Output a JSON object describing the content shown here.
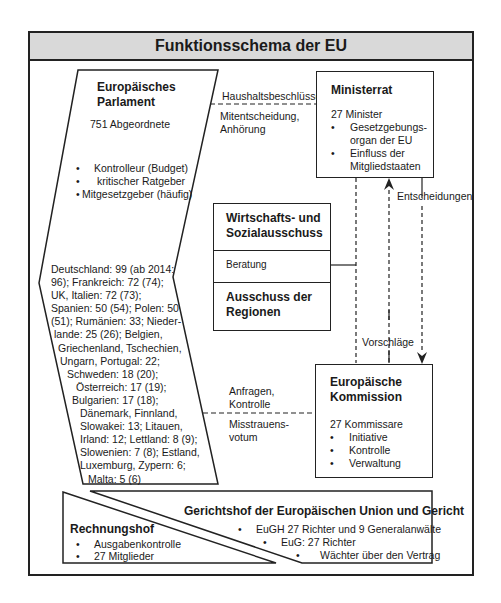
{
  "title": "Funktionsschema der EU",
  "parlament": {
    "name": "Europäisches Parlament",
    "name_line1": "Europäisches",
    "name_line2": "Parlament",
    "members": "751 Abgeordnete",
    "roles": [
      "Kontrolleur (Budget)",
      "kritischer Ratgeber",
      "Mitgesetzgeber (häufig)"
    ],
    "seats_lines": [
      "Deutschland: 99 (ab 2014:",
      "96); Frankreich: 72 (74);",
      "UK, Italien: 72 (73);",
      "Spanien: 50 (54); Polen: 50",
      "(51); Rumänien: 33; Nieder-",
      "lande: 25 (26); Belgien,",
      "Griechenland, Tschechien,",
      "Ungarn, Portugal: 22;",
      "Schweden: 18 (20);",
      "Österreich: 17 (19);",
      "Bulgarien: 17 (18);",
      "Dänemark, Finnland,",
      "Slowakei: 13; Litauen,",
      "Irland: 12; Lettland: 8 (9);",
      "Slowenien: 7 (8); Estland,",
      "Luxemburg, Zypern: 6;",
      "Malta: 5 (6)"
    ]
  },
  "ministerrat": {
    "name": "Ministerrat",
    "members": "27 Minister",
    "roles": [
      "Gesetzgebungs-",
      "organ der EU",
      "Einfluss der",
      "Mitgliedstaaten"
    ]
  },
  "ausschuesse": {
    "wsa_line1": "Wirtschafts- und",
    "wsa_line2": "Sozialausschuss",
    "beratung": "Beratung",
    "adr_line1": "Ausschuss der",
    "adr_line2": "Regionen"
  },
  "kommission": {
    "name_line1": "Europäische",
    "name_line2": "Kommission",
    "members": "27 Kommissare",
    "roles": [
      "Initiative",
      "Kontrolle",
      "Verwaltung"
    ]
  },
  "relations": {
    "ep_rat_top": "Haushaltsbeschlüsse,",
    "ep_rat_bottom_1": "Mitentscheidung,",
    "ep_rat_bottom_2": "Anhörung",
    "rat_kom": "Entscheidungen",
    "kom_rat": "Vorschläge",
    "ep_kom_top_1": "Anfragen,",
    "ep_kom_top_2": "Kontrolle",
    "ep_kom_bottom_1": "Misstrauens-",
    "ep_kom_bottom_2": "votum"
  },
  "rechnungshof": {
    "name": "Rechnungshof",
    "roles": [
      "Ausgabenkontrolle",
      "27 Mitglieder"
    ]
  },
  "gerichtshof": {
    "name": "Gerichtshof der Europäischen Union und Gericht",
    "roles": [
      "EuGH 27 Richter und 9 Generalanwälte",
      "EuG: 27 Richter",
      "Wächter über den Vertrag"
    ]
  }
}
